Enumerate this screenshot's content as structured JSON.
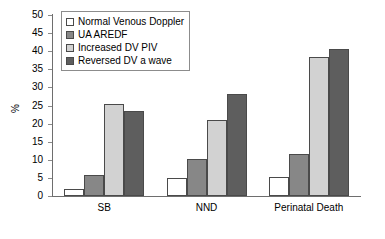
{
  "chart_data": {
    "type": "bar",
    "title": "",
    "subtitle": "",
    "xlabel": "",
    "ylabel": "%",
    "ylim": [
      0,
      50
    ],
    "ytick_step": 5,
    "yticks": [
      50,
      45,
      40,
      35,
      30,
      25,
      20,
      15,
      10,
      5,
      0
    ],
    "grid": false,
    "legend_position": "upper-left-inside",
    "categories": [
      "SB",
      "NND",
      "Perinatal Death"
    ],
    "series": [
      {
        "name": "Normal Venous Doppler",
        "color": "#ffffff",
        "values": [
          2.0,
          5.0,
          5.3
        ]
      },
      {
        "name": "UA AREDF",
        "color": "#878787",
        "values": [
          5.9,
          10.3,
          11.5
        ]
      },
      {
        "name": "Increased DV PIV",
        "color": "#d2d2d2",
        "values": [
          25.3,
          21.0,
          38.5
        ]
      },
      {
        "name": "Reversed DV a wave",
        "color": "#5e5e5e",
        "values": [
          23.6,
          28.3,
          40.7
        ]
      }
    ]
  }
}
